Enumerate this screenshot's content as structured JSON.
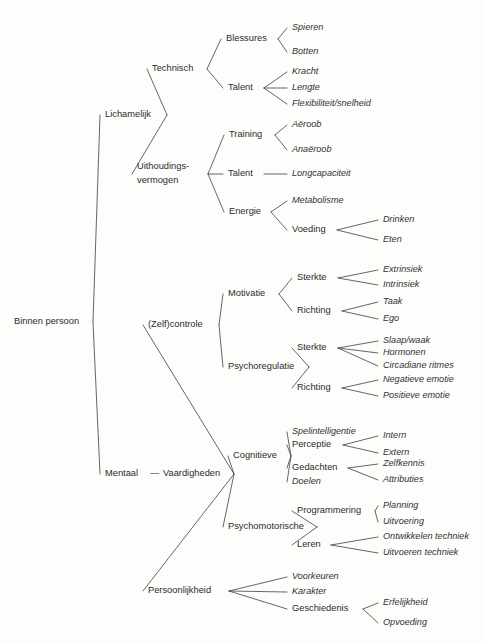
{
  "diagram": {
    "type": "hierarchy-tree",
    "title": "Binnen persoon",
    "language": "nl",
    "style": {
      "background": "#fdfdfc",
      "line_color": "#4a4a4a",
      "text_color": "#2b2b2b",
      "branch_label_style": "regular",
      "leaf_label_style": "italic"
    },
    "nodes": [
      {
        "id": "root",
        "label": "Binnen persoon",
        "x": 14,
        "y": 322,
        "anchor": "start",
        "leaf": false,
        "w": 74
      },
      {
        "id": "lichamelijk",
        "label": "Lichamelijk",
        "x": 105,
        "y": 115,
        "anchor": "start",
        "leaf": false,
        "w": 57
      },
      {
        "id": "technisch",
        "label": "Technisch",
        "x": 152,
        "y": 69,
        "anchor": "start",
        "leaf": false,
        "w": 50
      },
      {
        "id": "blessures",
        "label": "Blessures",
        "x": 226,
        "y": 39,
        "anchor": "start",
        "leaf": false,
        "w": 47
      },
      {
        "id": "spieren",
        "label": "Spieren",
        "x": 292,
        "y": 28,
        "anchor": "start",
        "leaf": true,
        "w": 38
      },
      {
        "id": "botten",
        "label": "Botten",
        "x": 292,
        "y": 52,
        "anchor": "start",
        "leaf": true,
        "w": 34
      },
      {
        "id": "talent1",
        "label": "Talent",
        "x": 228,
        "y": 88,
        "anchor": "start",
        "leaf": false,
        "w": 31
      },
      {
        "id": "kracht",
        "label": "Kracht",
        "x": 292,
        "y": 72,
        "anchor": "start",
        "leaf": true,
        "w": 34
      },
      {
        "id": "lengte",
        "label": "Lengte",
        "x": 292,
        "y": 88,
        "anchor": "start",
        "leaf": true,
        "w": 33
      },
      {
        "id": "flexibiliteit",
        "label": "Flexibiliteit/snelheid",
        "x": 292,
        "y": 104,
        "anchor": "start",
        "leaf": true,
        "w": 98
      },
      {
        "id": "uithoudings1",
        "label": "Uithoudings-",
        "x": 137,
        "y": 167,
        "anchor": "start",
        "leaf": false,
        "w": 64
      },
      {
        "id": "uithoudings2",
        "label": "vermogen",
        "x": 137,
        "y": 181,
        "anchor": "start",
        "leaf": false,
        "w": 51
      },
      {
        "id": "training",
        "label": "Training",
        "x": 229,
        "y": 135,
        "anchor": "start",
        "leaf": false,
        "w": 41
      },
      {
        "id": "aeroob",
        "label": "Aëroob",
        "x": 292,
        "y": 125,
        "anchor": "start",
        "leaf": true,
        "w": 38
      },
      {
        "id": "anaeroob",
        "label": "Anaëroob",
        "x": 292,
        "y": 150,
        "anchor": "start",
        "leaf": true,
        "w": 49
      },
      {
        "id": "talent2",
        "label": "Talent",
        "x": 228,
        "y": 174,
        "anchor": "start",
        "leaf": false,
        "w": 31
      },
      {
        "id": "longcapaciteit",
        "label": "Longcapaciteit",
        "x": 292,
        "y": 174,
        "anchor": "start",
        "leaf": true,
        "w": 67
      },
      {
        "id": "energie",
        "label": "Energie",
        "x": 229,
        "y": 212,
        "anchor": "start",
        "leaf": false,
        "w": 37
      },
      {
        "id": "metabolisme",
        "label": "Metabolisme",
        "x": 292,
        "y": 201,
        "anchor": "start",
        "leaf": true,
        "w": 62
      },
      {
        "id": "voeding",
        "label": "Voeding",
        "x": 292,
        "y": 230,
        "anchor": "start",
        "leaf": false,
        "w": 40
      },
      {
        "id": "drinken",
        "label": "Drinken",
        "x": 383,
        "y": 220,
        "anchor": "start",
        "leaf": true,
        "w": 38
      },
      {
        "id": "eten",
        "label": "Eten",
        "x": 383,
        "y": 240,
        "anchor": "start",
        "leaf": true,
        "w": 22
      },
      {
        "id": "mentaal",
        "label": "Mentaal",
        "x": 105,
        "y": 474,
        "anchor": "start",
        "leaf": false,
        "w": 41
      },
      {
        "id": "dash",
        "label": "—",
        "x": 150,
        "y": 474,
        "anchor": "start",
        "leaf": false,
        "w": 10
      },
      {
        "id": "vaardigheden",
        "label": "Vaardigheden",
        "x": 163,
        "y": 474,
        "anchor": "start",
        "leaf": false,
        "w": 66
      },
      {
        "id": "zelfcontrole",
        "label": "(Zelf)controle",
        "x": 148,
        "y": 325,
        "anchor": "start",
        "leaf": false,
        "w": 66
      },
      {
        "id": "motivatie",
        "label": "Motivatie",
        "x": 228,
        "y": 294,
        "anchor": "start",
        "leaf": false,
        "w": 46
      },
      {
        "id": "sterkte1",
        "label": "Sterkte",
        "x": 297,
        "y": 278,
        "anchor": "start",
        "leaf": false,
        "w": 36
      },
      {
        "id": "extrinsiek",
        "label": "Extrinsiek",
        "x": 383,
        "y": 270,
        "anchor": "start",
        "leaf": true,
        "w": 48
      },
      {
        "id": "intrinsiek",
        "label": "Intrinsiek",
        "x": 383,
        "y": 285,
        "anchor": "start",
        "leaf": true,
        "w": 44
      },
      {
        "id": "richting1",
        "label": "Richting",
        "x": 297,
        "y": 311,
        "anchor": "start",
        "leaf": false,
        "w": 40
      },
      {
        "id": "taak",
        "label": "Taak",
        "x": 383,
        "y": 302,
        "anchor": "start",
        "leaf": true,
        "w": 25
      },
      {
        "id": "ego",
        "label": "Ego",
        "x": 383,
        "y": 319,
        "anchor": "start",
        "leaf": true,
        "w": 20
      },
      {
        "id": "psychoregulatie",
        "label": "Psychoregulatie",
        "x": 228,
        "y": 367,
        "anchor": "start",
        "leaf": false,
        "w": 76
      },
      {
        "id": "sterkte2",
        "label": "Sterkte",
        "x": 297,
        "y": 348,
        "anchor": "start",
        "leaf": false,
        "w": 36
      },
      {
        "id": "slaapwaak",
        "label": "Slaap/waak",
        "x": 383,
        "y": 341,
        "anchor": "start",
        "leaf": true,
        "w": 55
      },
      {
        "id": "hormonen",
        "label": "Hormonen",
        "x": 383,
        "y": 353,
        "anchor": "start",
        "leaf": true,
        "w": 48
      },
      {
        "id": "circadiane",
        "label": "Circadiane ritmes",
        "x": 383,
        "y": 366,
        "anchor": "start",
        "leaf": true,
        "w": 80
      },
      {
        "id": "richting2",
        "label": "Richting",
        "x": 297,
        "y": 388,
        "anchor": "start",
        "leaf": false,
        "w": 40
      },
      {
        "id": "negatieve",
        "label": "Negatieve emotie",
        "x": 383,
        "y": 380,
        "anchor": "start",
        "leaf": true,
        "w": 80
      },
      {
        "id": "positieve",
        "label": "Positieve emotie",
        "x": 383,
        "y": 396,
        "anchor": "start",
        "leaf": true,
        "w": 76
      },
      {
        "id": "cognitieve",
        "label": "Cognitieve",
        "x": 233,
        "y": 456,
        "anchor": "start",
        "leaf": false,
        "w": 53
      },
      {
        "id": "spelintelligentie",
        "label": "Spelintelligentie",
        "x": 292,
        "y": 432,
        "anchor": "start",
        "leaf": true,
        "w": 76
      },
      {
        "id": "perceptie",
        "label": "Perceptie",
        "x": 292,
        "y": 445,
        "anchor": "start",
        "leaf": false,
        "w": 46
      },
      {
        "id": "intern",
        "label": "Intern",
        "x": 383,
        "y": 436,
        "anchor": "start",
        "leaf": true,
        "w": 29
      },
      {
        "id": "extern",
        "label": "Extern",
        "x": 383,
        "y": 453,
        "anchor": "start",
        "leaf": true,
        "w": 31
      },
      {
        "id": "gedachten",
        "label": "Gedachten",
        "x": 292,
        "y": 468,
        "anchor": "start",
        "leaf": false,
        "w": 51
      },
      {
        "id": "zelfkennis",
        "label": "Zelfkennis",
        "x": 383,
        "y": 464,
        "anchor": "start",
        "leaf": true,
        "w": 47
      },
      {
        "id": "attributies",
        "label": "Attributies",
        "x": 383,
        "y": 480,
        "anchor": "start",
        "leaf": true,
        "w": 47
      },
      {
        "id": "doelen",
        "label": "Doelen",
        "x": 292,
        "y": 482,
        "anchor": "start",
        "leaf": true,
        "w": 34
      },
      {
        "id": "psychomotorische",
        "label": "Psychomotorische",
        "x": 228,
        "y": 527,
        "anchor": "start",
        "leaf": false,
        "w": 84
      },
      {
        "id": "programmering",
        "label": "Programmering",
        "x": 297,
        "y": 511,
        "anchor": "start",
        "leaf": false,
        "w": 73
      },
      {
        "id": "planning",
        "label": "Planning",
        "x": 383,
        "y": 506,
        "anchor": "start",
        "leaf": true,
        "w": 41
      },
      {
        "id": "uitvoering",
        "label": "Uitvoering",
        "x": 383,
        "y": 522,
        "anchor": "start",
        "leaf": true,
        "w": 47
      },
      {
        "id": "leren",
        "label": "Leren",
        "x": 297,
        "y": 545,
        "anchor": "start",
        "leaf": false,
        "w": 29
      },
      {
        "id": "ontwikkelen",
        "label": "Ontwikkelen techniek",
        "x": 383,
        "y": 537,
        "anchor": "start",
        "leaf": true,
        "w": 94
      },
      {
        "id": "uitvoeren",
        "label": "Uitvoeren techniek",
        "x": 383,
        "y": 553,
        "anchor": "start",
        "leaf": true,
        "w": 84
      },
      {
        "id": "persoonlijkheid",
        "label": "Persoonlijkheid",
        "x": 148,
        "y": 591,
        "anchor": "start",
        "leaf": false,
        "w": 76
      },
      {
        "id": "voorkeuren",
        "label": "Voorkeuren",
        "x": 292,
        "y": 577,
        "anchor": "start",
        "leaf": true,
        "w": 54
      },
      {
        "id": "karakter",
        "label": "Karakter",
        "x": 292,
        "y": 592,
        "anchor": "start",
        "leaf": true,
        "w": 42
      },
      {
        "id": "geschiedenis",
        "label": "Geschiedenis",
        "x": 292,
        "y": 609,
        "anchor": "start",
        "leaf": false,
        "w": 66
      },
      {
        "id": "erfelijkheid",
        "label": "Erfelijkheid",
        "x": 383,
        "y": 603,
        "anchor": "start",
        "leaf": true,
        "w": 55
      },
      {
        "id": "opvoeding",
        "label": "Opvoeding",
        "x": 383,
        "y": 623,
        "anchor": "start",
        "leaf": true,
        "w": 50
      }
    ],
    "edges": [
      {
        "from": "root",
        "to": "lichamelijk"
      },
      {
        "from": "root",
        "to": "mentaal"
      },
      {
        "from": "lichamelijk",
        "to": "technisch"
      },
      {
        "from": "lichamelijk",
        "to": "uithoudings1"
      },
      {
        "from": "technisch",
        "to": "blessures"
      },
      {
        "from": "technisch",
        "to": "talent1"
      },
      {
        "from": "blessures",
        "to": "spieren"
      },
      {
        "from": "blessures",
        "to": "botten"
      },
      {
        "from": "talent1",
        "to": "kracht"
      },
      {
        "from": "talent1",
        "to": "lengte"
      },
      {
        "from": "talent1",
        "to": "flexibiliteit"
      },
      {
        "from": "uithoudings1",
        "to": "training"
      },
      {
        "from": "uithoudings1",
        "to": "talent2"
      },
      {
        "from": "uithoudings1",
        "to": "energie"
      },
      {
        "from": "training",
        "to": "aeroob"
      },
      {
        "from": "training",
        "to": "anaeroob"
      },
      {
        "from": "talent2",
        "to": "longcapaciteit"
      },
      {
        "from": "energie",
        "to": "metabolisme"
      },
      {
        "from": "energie",
        "to": "voeding"
      },
      {
        "from": "voeding",
        "to": "drinken"
      },
      {
        "from": "voeding",
        "to": "eten"
      },
      {
        "from": "mentaal",
        "to": "zelfcontrole"
      },
      {
        "from": "mentaal",
        "to": "persoonlijkheid"
      },
      {
        "from": "zelfcontrole",
        "to": "motivatie"
      },
      {
        "from": "zelfcontrole",
        "to": "psychoregulatie"
      },
      {
        "from": "motivatie",
        "to": "sterkte1"
      },
      {
        "from": "motivatie",
        "to": "richting1"
      },
      {
        "from": "sterkte1",
        "to": "extrinsiek"
      },
      {
        "from": "sterkte1",
        "to": "intrinsiek"
      },
      {
        "from": "richting1",
        "to": "taak"
      },
      {
        "from": "richting1",
        "to": "ego"
      },
      {
        "from": "psychoregulatie",
        "to": "sterkte2"
      },
      {
        "from": "psychoregulatie",
        "to": "richting2"
      },
      {
        "from": "sterkte2",
        "to": "slaapwaak"
      },
      {
        "from": "sterkte2",
        "to": "hormonen"
      },
      {
        "from": "sterkte2",
        "to": "circadiane"
      },
      {
        "from": "richting2",
        "to": "negatieve"
      },
      {
        "from": "richting2",
        "to": "positieve"
      },
      {
        "from": "vaardigheden",
        "to": "cognitieve"
      },
      {
        "from": "vaardigheden",
        "to": "psychomotorische"
      },
      {
        "from": "cognitieve",
        "to": "spelintelligentie"
      },
      {
        "from": "cognitieve",
        "to": "perceptie"
      },
      {
        "from": "cognitieve",
        "to": "gedachten"
      },
      {
        "from": "cognitieve",
        "to": "doelen"
      },
      {
        "from": "perceptie",
        "to": "intern"
      },
      {
        "from": "perceptie",
        "to": "extern"
      },
      {
        "from": "gedachten",
        "to": "zelfkennis"
      },
      {
        "from": "gedachten",
        "to": "attributies"
      },
      {
        "from": "psychomotorische",
        "to": "programmering"
      },
      {
        "from": "psychomotorische",
        "to": "leren"
      },
      {
        "from": "programmering",
        "to": "planning"
      },
      {
        "from": "programmering",
        "to": "uitvoering"
      },
      {
        "from": "leren",
        "to": "ontwikkelen"
      },
      {
        "from": "leren",
        "to": "uitvoeren"
      },
      {
        "from": "persoonlijkheid",
        "to": "voorkeuren"
      },
      {
        "from": "persoonlijkheid",
        "to": "karakter"
      },
      {
        "from": "persoonlijkheid",
        "to": "geschiedenis"
      },
      {
        "from": "geschiedenis",
        "to": "erfelijkheid"
      },
      {
        "from": "geschiedenis",
        "to": "opvoeding"
      }
    ]
  }
}
